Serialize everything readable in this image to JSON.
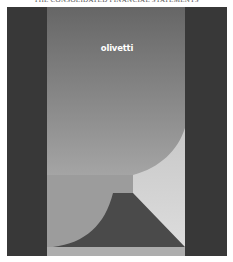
{
  "header": {
    "title": "THE CONSOLIDATED FINANCIAL STATEMENTS"
  },
  "cover": {
    "logo_text": "olivetti",
    "colors": {
      "dark_band": "#3a3a3a",
      "panel_top": "#6a6a6a",
      "panel_bottom": "#cfcfcf",
      "mid_rect": "#9a9a9a",
      "light_curve": "#d6d6d6",
      "mountain": "#4a4a4a",
      "base_strip": "#b0b0b0",
      "logo": "#ffffff"
    }
  }
}
